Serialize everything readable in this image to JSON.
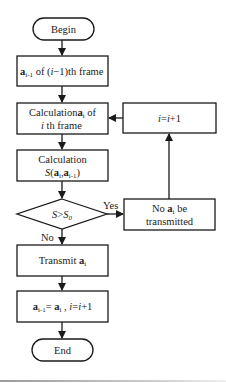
{
  "flowchart": {
    "begin": {
      "label": "Begin"
    },
    "prev_frame": {
      "vec": "a",
      "sub": "i-1",
      "rest_pre": " of (",
      "var": "i",
      "rest_post": "−1)th frame"
    },
    "calc_frame": {
      "line1_pre": "Calculation",
      "vec": "a",
      "sub": "i",
      "line1_post": " of",
      "line2_var": "i",
      "line2_rest": " th frame"
    },
    "calc_s": {
      "line1": "Calculation",
      "fn": "S",
      "open": "(",
      "vec1": "a",
      "sub1": "i",
      "comma": ",",
      "vec2": "a",
      "sub2": "i-1",
      "close": ")"
    },
    "decision": {
      "var": "S",
      "op": ">",
      "var2": "S",
      "sub": "0"
    },
    "yes_label": "Yes",
    "no_label": "No",
    "not_transmitted": {
      "line1_pre": "No ",
      "vec": "a",
      "sub": "i",
      "line1_post": " be",
      "line2": "transmitted"
    },
    "increment": {
      "var": "i",
      "eq": "=",
      "var2": "i",
      "rest": "+1"
    },
    "transmit": {
      "pre": "Transmit ",
      "vec": "a",
      "sub": "i"
    },
    "assign": {
      "vec1": "a",
      "sub1": "i-1",
      "eq": "= ",
      "vec2": "a",
      "sub2": "i",
      "sep": " ,  ",
      "var": "i",
      "eq2": "=",
      "var2": "i",
      "rest": "+1"
    },
    "end": {
      "label": "End"
    }
  },
  "colors": {
    "stroke": "#1a1a1a",
    "text": "#222222",
    "background": "#ffffff"
  }
}
